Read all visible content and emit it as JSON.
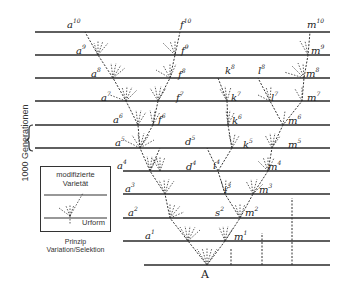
{
  "diagram": {
    "side_label": "1000 Generationen",
    "root_label": "A",
    "legend": {
      "title_line1": "modifizierte",
      "title_line2": "Varietät",
      "bottom_label": "Urform"
    },
    "caption_line1": "Prinzip",
    "caption_line2": "Variation/Selektion",
    "labels": {
      "a10": {
        "base": "a",
        "sup": "10"
      },
      "f10": {
        "base": "f",
        "sup": "10"
      },
      "m10": {
        "base": "m",
        "sup": "10"
      },
      "a9": {
        "base": "a",
        "sup": "9"
      },
      "f9": {
        "base": "f",
        "sup": "9"
      },
      "m9": {
        "base": "m",
        "sup": "9"
      },
      "a8": {
        "base": "a",
        "sup": "8"
      },
      "f8": {
        "base": "f",
        "sup": "8"
      },
      "k8": {
        "base": "k",
        "sup": "8"
      },
      "l8": {
        "base": "l",
        "sup": "8"
      },
      "m8": {
        "base": "m",
        "sup": "8"
      },
      "a7": {
        "base": "a",
        "sup": "7"
      },
      "f7": {
        "base": "f",
        "sup": "7"
      },
      "k7": {
        "base": "k",
        "sup": "7"
      },
      "l7": {
        "base": "l",
        "sup": "7"
      },
      "m7": {
        "base": "m",
        "sup": "7"
      },
      "a6": {
        "base": "a",
        "sup": "6"
      },
      "f6": {
        "base": "f",
        "sup": "6"
      },
      "k6": {
        "base": "k",
        "sup": "6"
      },
      "m6": {
        "base": "m",
        "sup": "6"
      },
      "a5": {
        "base": "a",
        "sup": "5"
      },
      "d5": {
        "base": "d",
        "sup": "5"
      },
      "k5": {
        "base": "k",
        "sup": "5"
      },
      "m5": {
        "base": "m",
        "sup": "5"
      },
      "a4": {
        "base": "a",
        "sup": "4"
      },
      "d4": {
        "base": "d",
        "sup": "4"
      },
      "i4": {
        "base": "i",
        "sup": "4"
      },
      "m4": {
        "base": "m",
        "sup": "4"
      },
      "a3": {
        "base": "a",
        "sup": "3"
      },
      "i3": {
        "base": "i",
        "sup": "3"
      },
      "m3": {
        "base": "m",
        "sup": "3"
      },
      "a2": {
        "base": "a",
        "sup": "2"
      },
      "s2": {
        "base": "s",
        "sup": "2"
      },
      "m2": {
        "base": "m",
        "sup": "2"
      },
      "a1": {
        "base": "a",
        "sup": "1"
      },
      "m1": {
        "base": "m",
        "sup": "1"
      }
    }
  }
}
